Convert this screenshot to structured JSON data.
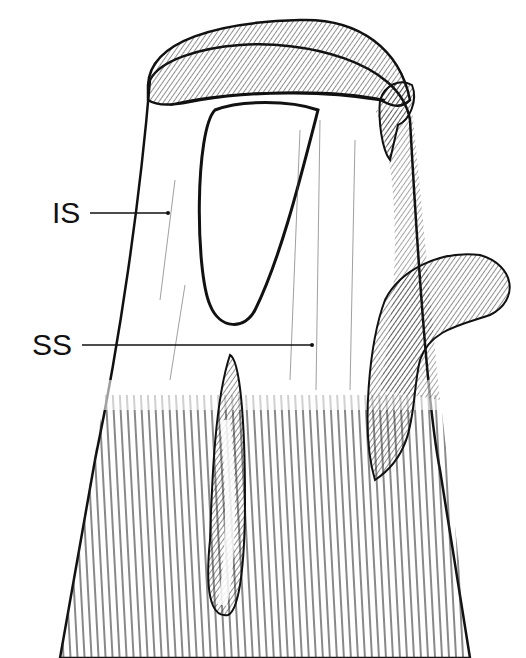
{
  "figure": {
    "type": "anatomical line drawing",
    "labels": [
      {
        "id": "IS",
        "text": "IS",
        "x": 52,
        "y": 198,
        "pointer_to": [
          168,
          213
        ]
      },
      {
        "id": "SS",
        "text": "SS",
        "x": 32,
        "y": 330,
        "pointer_to": [
          312,
          345
        ]
      }
    ]
  }
}
